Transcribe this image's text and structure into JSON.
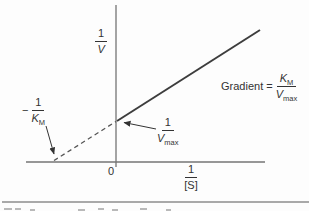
{
  "figure": {
    "y_axis_label": {
      "num": "1",
      "den": "V"
    },
    "x_axis_label": {
      "num": "1",
      "den": "[S]"
    },
    "origin": "0",
    "x_intercept": {
      "sign": "−",
      "num": "1",
      "den_base": "K",
      "den_sub": "M"
    },
    "y_intercept": {
      "num": "1",
      "den_base": "V",
      "den_sub": "max"
    },
    "gradient": {
      "prefix": "Gradient =",
      "num_base": "K",
      "num_sub": "M",
      "den_base": "V",
      "den_sub": "max"
    },
    "colors": {
      "line": "#3d3d3d",
      "axis": "#757575",
      "text": "#333333",
      "divider": "#8c8c8c",
      "bg": "#fdfdfd"
    }
  }
}
